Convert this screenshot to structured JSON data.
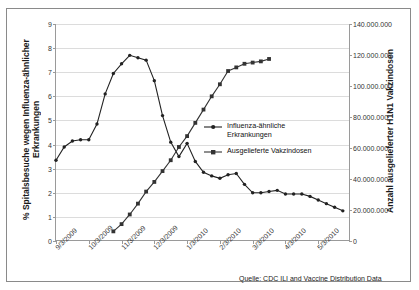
{
  "axes": {
    "left_title": "% Spitalsbesuche wegen Influenza-ähnlicher Erkrankungen",
    "right_title": "Anzahl ausgelieferter H1N1 Vakzindosen"
  },
  "source_note": "Quelle: CDC ILI and Vaccine Distribution Data",
  "legend": {
    "items": [
      {
        "label": "Influenza-ähnliche Erkrankungen",
        "marker": "diamond-marker",
        "color": "#222222"
      },
      {
        "label": "Ausgelieferte Vakzindosen",
        "marker": "square-marker",
        "color": "#333333"
      }
    ]
  },
  "chart_data": {
    "type": "line",
    "title": "",
    "xlabel": "",
    "ylabel": "% Spitalsbesuche wegen Influenza-ähnlicher Erkrankungen",
    "y2label": "Anzahl ausgelieferter H1N1 Vakzindosen",
    "ylim": [
      0,
      9
    ],
    "y2lim": [
      0,
      140000000
    ],
    "yticks": [
      "0",
      "1",
      "2",
      "3",
      "4",
      "5",
      "6",
      "7",
      "8",
      "9"
    ],
    "y2ticks": [
      "0",
      "20.000.000",
      "40.000.000",
      "60.000.000",
      "80.000.000",
      "100.000.000",
      "120.000.000",
      "140.000.000"
    ],
    "grid": true,
    "legend_position": "center-right",
    "xticks": [
      "9/3/2009",
      "10/3/2009",
      "11/3/2009",
      "12/3/2009",
      "1/3/2010",
      "2/3/2010",
      "3/3/2010",
      "4/3/2010",
      "5/3/2010"
    ],
    "xlim_weeks": [
      0,
      36
    ],
    "series": [
      {
        "name": "Influenza-ähnliche Erkrankungen",
        "axis": "left",
        "color": "#222222",
        "x": [
          0,
          1,
          2,
          3,
          4,
          5,
          6,
          7,
          8,
          9,
          10,
          11,
          12,
          13,
          14,
          15,
          16,
          17,
          18,
          19,
          20,
          21,
          22,
          23,
          24,
          25,
          26,
          27,
          28,
          29,
          30,
          31,
          32,
          33,
          34,
          35
        ],
        "values": [
          3.35,
          3.9,
          4.15,
          4.2,
          4.2,
          4.85,
          6.1,
          6.95,
          7.35,
          7.7,
          7.6,
          7.5,
          6.65,
          5.2,
          4.1,
          3.5,
          4.05,
          3.3,
          2.85,
          2.7,
          2.6,
          2.75,
          2.8,
          2.35,
          2.0,
          2.0,
          2.05,
          2.1,
          1.95,
          1.95,
          1.95,
          1.85,
          1.7,
          1.55,
          1.4,
          1.25
        ]
      },
      {
        "name": "Ausgelieferte Vakzindosen",
        "axis": "right",
        "color": "#333333",
        "x": [
          7,
          8,
          9,
          10,
          11,
          12,
          13,
          14,
          15,
          16,
          17,
          18,
          19,
          20,
          21,
          22,
          23,
          24,
          25,
          26
        ],
        "values": [
          0.4,
          0.7,
          1.1,
          1.55,
          2.05,
          2.45,
          2.9,
          3.35,
          3.9,
          4.35,
          4.9,
          5.45,
          6.0,
          6.5,
          7.05,
          7.2,
          7.35,
          7.4,
          7.45,
          7.55
        ]
      }
    ]
  }
}
